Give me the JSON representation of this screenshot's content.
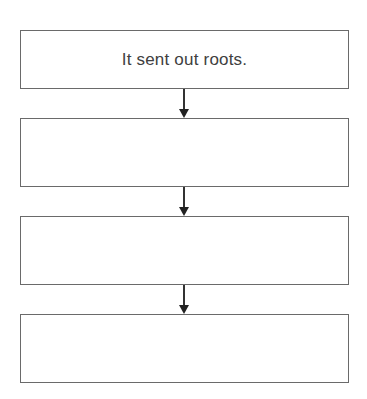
{
  "diagram": {
    "type": "vertical-flowchart",
    "top_text_cut": "",
    "boxes": [
      {
        "text": "It sent out roots."
      },
      {
        "text": ""
      },
      {
        "text": ""
      },
      {
        "text": ""
      }
    ],
    "colors": {
      "border": "#6a6a6a",
      "text": "#404040",
      "arrow": "#222222"
    }
  }
}
